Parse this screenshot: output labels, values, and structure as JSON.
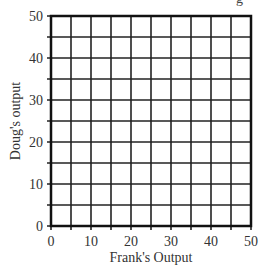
{
  "header": {
    "clipped_text": "g"
  },
  "chart_data": {
    "type": "scatter",
    "title": "",
    "xlabel": "Frank's Output",
    "ylabel": "Doug's output",
    "xlim": [
      0,
      50
    ],
    "ylim": [
      0,
      50
    ],
    "xticks": [
      0,
      10,
      20,
      30,
      40,
      50
    ],
    "yticks": [
      0,
      10,
      20,
      30,
      40,
      50
    ],
    "grid": true,
    "grid_step": 5,
    "series": [],
    "legend": null
  },
  "colors": {
    "grid": "#222222",
    "axis": "#111111",
    "text": "#333333"
  }
}
